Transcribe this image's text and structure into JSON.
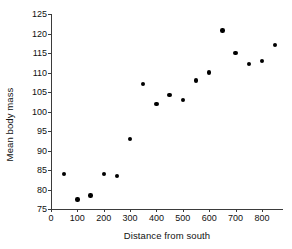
{
  "chart_data": {
    "type": "scatter",
    "title": "",
    "xlabel": "Distance from south",
    "ylabel": "Mean body mass",
    "xlim": [
      0,
      880
    ],
    "ylim": [
      75,
      125
    ],
    "xticks": [
      0,
      100,
      200,
      300,
      400,
      500,
      600,
      700,
      800
    ],
    "yticks": [
      75,
      80,
      85,
      90,
      95,
      100,
      105,
      110,
      115,
      120,
      125
    ],
    "xtick_labels": [
      "0",
      "100",
      "200",
      "300",
      "400",
      "500",
      "600",
      "700",
      "800"
    ],
    "ytick_labels": [
      "75",
      "80",
      "85",
      "90",
      "95",
      "100",
      "105",
      "110",
      "115",
      "120",
      "125"
    ],
    "grid": false,
    "legend": false,
    "marker_color": "#000000",
    "axis_color": "#3b3b3b",
    "series": [
      {
        "name": "body mass by distance",
        "x": [
          50,
          100,
          150,
          200,
          250,
          300,
          350,
          400,
          450,
          500,
          550,
          600,
          650,
          700,
          750,
          800,
          850
        ],
        "y": [
          84,
          77.4,
          78.5,
          84,
          83.5,
          93,
          107,
          102,
          104.2,
          103,
          108,
          110,
          120.8,
          115,
          112.2,
          113,
          117
        ]
      }
    ]
  }
}
